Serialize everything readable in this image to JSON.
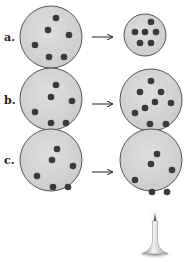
{
  "colors": {
    "circle_fill": "#d4d4d4",
    "circle_stroke": "#555555",
    "particle": "#3a3a3a",
    "arrow": "#222222"
  },
  "rows": [
    {
      "label": "a.",
      "label_pos": [
        4,
        31
      ],
      "left": {
        "cx": 51,
        "cy": 37,
        "r": 31,
        "particles": [
          [
            56,
            18
          ],
          [
            48,
            30
          ],
          [
            69,
            35
          ],
          [
            35,
            45
          ],
          [
            49,
            57
          ],
          [
            64,
            57
          ]
        ]
      },
      "arrow": {
        "x1": 92,
        "x2": 112,
        "y": 37
      },
      "right": {
        "cx": 145,
        "cy": 35,
        "r": 21,
        "particles": [
          [
            151,
            22
          ],
          [
            135,
            32
          ],
          [
            145,
            32
          ],
          [
            156,
            32
          ],
          [
            140,
            43
          ],
          [
            151,
            43
          ]
        ]
      }
    },
    {
      "label": "b.",
      "label_pos": [
        4,
        94
      ],
      "left": {
        "cx": 51,
        "cy": 99,
        "r": 31,
        "particles": [
          [
            56,
            85
          ],
          [
            51,
            97
          ],
          [
            72,
            101
          ],
          [
            35,
            112
          ],
          [
            51,
            123
          ],
          [
            66,
            123
          ]
        ]
      },
      "arrow": {
        "x1": 92,
        "x2": 112,
        "y": 104
      },
      "right": {
        "cx": 151,
        "cy": 100,
        "r": 31,
        "particles": [
          [
            151,
            81
          ],
          [
            140,
            92
          ],
          [
            161,
            92
          ],
          [
            155,
            102
          ],
          [
            171,
            103
          ],
          [
            145,
            108
          ],
          [
            135,
            113
          ],
          [
            150,
            124
          ],
          [
            166,
            124
          ]
        ]
      }
    },
    {
      "label": "c.",
      "label_pos": [
        4,
        154
      ],
      "left": {
        "cx": 51,
        "cy": 160,
        "r": 31,
        "particles": [
          [
            57,
            149
          ],
          [
            52,
            160
          ],
          [
            73,
            166
          ],
          [
            37,
            176
          ],
          [
            53,
            187
          ],
          [
            68,
            187
          ]
        ]
      },
      "arrow": {
        "x1": 92,
        "x2": 112,
        "y": 172
      },
      "right": {
        "cx": 151,
        "cy": 160,
        "r": 31,
        "particles": [
          [
            157,
            154
          ],
          [
            151,
            164
          ],
          [
            172,
            170
          ],
          [
            135,
            180
          ],
          [
            152,
            192
          ],
          [
            167,
            192
          ]
        ]
      }
    }
  ],
  "burner": {
    "x": 155,
    "top": 213,
    "bottom": 254
  }
}
